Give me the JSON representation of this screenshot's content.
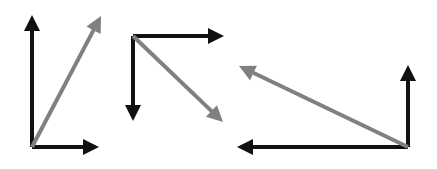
{
  "colors": {
    "background": "#ffffff",
    "component": "#111111",
    "resultant": "#808080"
  },
  "stroke_width": {
    "component": 4,
    "resultant": 4
  },
  "diagrams": [
    {
      "id": "diagram-1",
      "label": "Up and right components with resultant up-right",
      "origin": [
        32,
        147
      ],
      "vectors": [
        {
          "name": "vertical-up-component",
          "kind": "component",
          "from": [
            32,
            147
          ],
          "to": [
            32,
            15
          ]
        },
        {
          "name": "horizontal-right-component",
          "kind": "component",
          "from": [
            32,
            147
          ],
          "to": [
            99,
            147
          ]
        },
        {
          "name": "resultant-up-right",
          "kind": "resultant",
          "from": [
            32,
            147
          ],
          "to": [
            101,
            16
          ]
        }
      ]
    },
    {
      "id": "diagram-2",
      "label": "Right and down components with resultant down-right",
      "origin": [
        133,
        36
      ],
      "vectors": [
        {
          "name": "horizontal-right-component",
          "kind": "component",
          "from": [
            133,
            36
          ],
          "to": [
            224,
            36
          ]
        },
        {
          "name": "vertical-down-component",
          "kind": "component",
          "from": [
            133,
            36
          ],
          "to": [
            133,
            121
          ]
        },
        {
          "name": "resultant-down-right",
          "kind": "resultant",
          "from": [
            133,
            36
          ],
          "to": [
            223,
            122
          ]
        }
      ]
    },
    {
      "id": "diagram-3",
      "label": "Up and left components with resultant up-left",
      "origin": [
        408,
        147
      ],
      "vectors": [
        {
          "name": "vertical-up-component",
          "kind": "component",
          "from": [
            408,
            147
          ],
          "to": [
            408,
            65
          ]
        },
        {
          "name": "horizontal-left-component",
          "kind": "component",
          "from": [
            408,
            147
          ],
          "to": [
            237,
            147
          ]
        },
        {
          "name": "resultant-up-left",
          "kind": "resultant",
          "from": [
            408,
            147
          ],
          "to": [
            239,
            66
          ]
        }
      ]
    }
  ]
}
